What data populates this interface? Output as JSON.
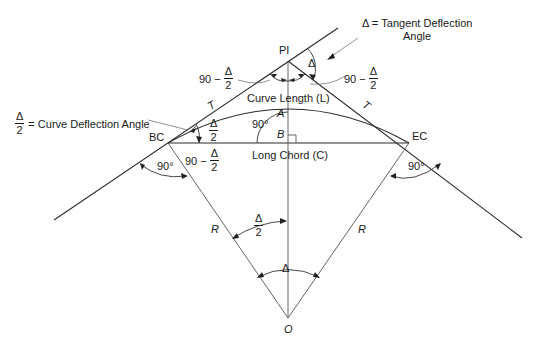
{
  "diagram": {
    "type": "horizontal circular curve geometry",
    "points": {
      "pi": "PI",
      "bc": "BC",
      "ec": "EC",
      "center": "O",
      "a": "A",
      "b": "B"
    },
    "segments": {
      "tangent_left": "T",
      "tangent_right": "T",
      "radius_left": "R",
      "radius_right": "R",
      "curve_length": "Curve Length (L)",
      "long_chord": "Long Chord (C)"
    },
    "angles": {
      "right_angle_bc": "90°",
      "right_angle_ec": "90°",
      "right_angle_ab": "90°",
      "delta_symbol": "Δ",
      "half_num": "Δ",
      "half_den": "2",
      "ninety_minus": "90 −"
    },
    "annotations": {
      "tangent_deflection_line1": "Δ = Tangent Deflection",
      "tangent_deflection_line2": "Angle",
      "curve_deflection_num": "Δ",
      "curve_deflection_den": "2",
      "curve_deflection_text": "= Curve Deflection Angle"
    }
  }
}
